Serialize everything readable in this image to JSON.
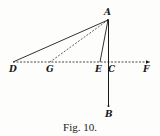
{
  "figure": {
    "caption": "Fig. 10.",
    "labels": {
      "A": "A",
      "B": "B",
      "C": "C",
      "D": "D",
      "E": "E",
      "F": "F",
      "G": "G"
    },
    "colors": {
      "ink": "#1a1a1a",
      "paper": "#fdfdfb"
    }
  }
}
